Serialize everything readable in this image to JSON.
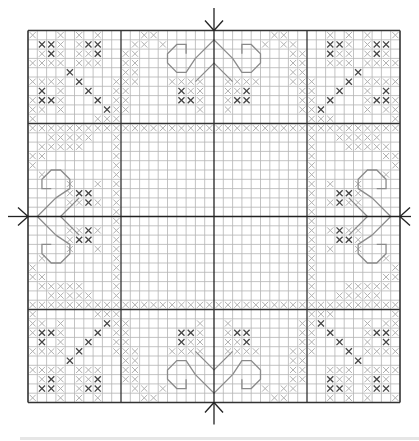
{
  "chart_data": {
    "type": "cross-stitch-grid",
    "columns": 40,
    "rows": 40,
    "grid": {
      "left": 28,
      "top": 30.5,
      "cell": 9.3
    },
    "major_lines_every": 10,
    "center_markers": [
      "top",
      "bottom",
      "left",
      "right"
    ],
    "symmetry": "4-fold mirror (quadrant defined, mirrored horizontally and vertically)",
    "colors": {
      "grid_minor": "#b4b4b4",
      "grid_major": "#333333",
      "stitch_light": "#b0b0b0",
      "stitch_dark": "#444444",
      "backstitch": "#8a8a8a",
      "center_line": "#222222"
    },
    "legend": {
      "L": "light gray cross stitch",
      "D": "dark gray cross stitch"
    },
    "quadrant_top_left": {
      "light": [
        [
          0,
          0
        ],
        [
          3,
          0
        ],
        [
          5,
          0
        ],
        [
          7,
          0
        ],
        [
          12,
          0
        ],
        [
          13,
          0
        ],
        [
          3,
          1
        ],
        [
          5,
          1
        ],
        [
          11,
          1
        ],
        [
          12,
          1
        ],
        [
          14,
          1
        ],
        [
          1,
          2
        ],
        [
          3,
          2
        ],
        [
          5,
          2
        ],
        [
          6,
          2
        ],
        [
          10,
          2
        ],
        [
          11,
          2
        ],
        [
          0,
          3
        ],
        [
          1,
          3
        ],
        [
          2,
          3
        ],
        [
          3,
          3
        ],
        [
          5,
          3
        ],
        [
          6,
          3
        ],
        [
          7,
          3
        ],
        [
          10,
          3
        ],
        [
          11,
          3
        ],
        [
          10,
          4
        ],
        [
          11,
          4
        ],
        [
          0,
          5
        ],
        [
          1,
          5
        ],
        [
          2,
          5
        ],
        [
          3,
          5
        ],
        [
          9,
          5
        ],
        [
          10,
          5
        ],
        [
          11,
          5
        ],
        [
          15,
          5
        ],
        [
          16,
          5
        ],
        [
          17,
          5
        ],
        [
          18,
          5
        ],
        [
          3,
          6
        ],
        [
          9,
          6
        ],
        [
          10,
          6
        ],
        [
          17,
          6
        ],
        [
          18,
          6
        ],
        [
          0,
          7
        ],
        [
          3,
          7
        ],
        [
          9,
          7
        ],
        [
          10,
          7
        ],
        [
          16,
          7
        ],
        [
          18,
          7
        ],
        [
          0,
          8
        ],
        [
          1,
          8
        ],
        [
          3,
          8
        ],
        [
          9,
          8
        ],
        [
          10,
          8
        ],
        [
          18,
          8
        ],
        [
          0,
          9
        ],
        [
          7,
          9
        ],
        [
          8,
          9
        ],
        [
          9,
          9
        ],
        [
          0,
          10
        ],
        [
          1,
          10
        ],
        [
          2,
          10
        ],
        [
          3,
          10
        ],
        [
          4,
          10
        ],
        [
          5,
          10
        ],
        [
          6,
          10
        ],
        [
          7,
          10
        ],
        [
          8,
          10
        ],
        [
          9,
          10
        ],
        [
          10,
          10
        ],
        [
          11,
          10
        ],
        [
          12,
          10
        ],
        [
          13,
          10
        ],
        [
          14,
          10
        ],
        [
          15,
          10
        ],
        [
          16,
          10
        ],
        [
          17,
          10
        ],
        [
          18,
          10
        ],
        [
          19,
          10
        ],
        [
          2,
          11
        ],
        [
          3,
          11
        ],
        [
          4,
          11
        ],
        [
          5,
          11
        ],
        [
          6,
          11
        ],
        [
          9,
          11
        ],
        [
          1,
          12
        ],
        [
          2,
          12
        ],
        [
          3,
          12
        ],
        [
          4,
          12
        ],
        [
          5,
          12
        ],
        [
          9,
          12
        ],
        [
          0,
          13
        ],
        [
          1,
          13
        ],
        [
          9,
          13
        ],
        [
          0,
          14
        ],
        [
          9,
          14
        ],
        [
          1,
          15
        ],
        [
          9,
          15
        ],
        [
          4,
          16
        ],
        [
          7,
          16
        ],
        [
          9,
          16
        ],
        [
          4,
          17
        ],
        [
          5,
          17
        ],
        [
          6,
          17
        ],
        [
          9,
          17
        ],
        [
          4,
          18
        ],
        [
          5,
          18
        ],
        [
          6,
          18
        ],
        [
          7,
          18
        ],
        [
          9,
          18
        ],
        [
          9,
          19
        ]
      ],
      "dark": [
        [
          1,
          1
        ],
        [
          2,
          1
        ],
        [
          6,
          1
        ],
        [
          7,
          1
        ],
        [
          2,
          2
        ],
        [
          7,
          2
        ],
        [
          4,
          4
        ],
        [
          5,
          5
        ],
        [
          1,
          6
        ],
        [
          6,
          6
        ],
        [
          1,
          7
        ],
        [
          2,
          7
        ],
        [
          7,
          7
        ],
        [
          8,
          8
        ],
        [
          16,
          6
        ],
        [
          16,
          7
        ],
        [
          17,
          7
        ],
        [
          5,
          17
        ],
        [
          6,
          17
        ],
        [
          6,
          18
        ]
      ],
      "backstitch_motif": "heart/leaf outline near center edge"
    }
  }
}
